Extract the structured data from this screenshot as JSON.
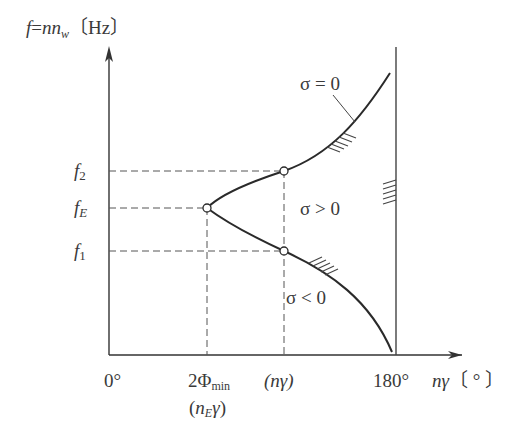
{
  "title": {
    "f": "f",
    "eq": "=",
    "n1": "n",
    "n2": "n",
    "sub": "w",
    "unit": "〔Hz〕"
  },
  "y_labels": [
    {
      "main": "f",
      "sub": "2"
    },
    {
      "main": "f",
      "sub": "E"
    },
    {
      "main": "f",
      "sub": "1"
    }
  ],
  "x_labels": {
    "zero": "0°",
    "phi_main": "2Φ",
    "phi_sub": "min",
    "ne_open": "(",
    "ne_n": "n",
    "ne_sub": "E",
    "ne_gamma": "γ",
    "ne_close": ")",
    "ngamma": "(nγ)",
    "deg180": "180°",
    "axis_main": "nγ",
    "axis_unit": "〔 ° 〕"
  },
  "regions": {
    "sigma_zero": "σ = 0",
    "sigma_pos": "σ > 0",
    "sigma_neg": "σ < 0"
  },
  "colors": {
    "line": "#2a2a2a",
    "dash": "#555555",
    "text": "#3a3a3a"
  }
}
